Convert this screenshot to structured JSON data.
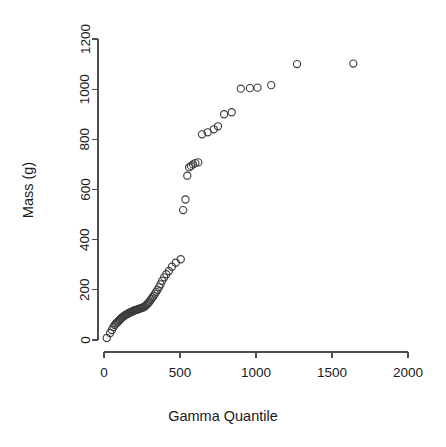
{
  "plot": {
    "type": "scatter",
    "point_symbol": "open-circle",
    "point_radius_px": 3.6,
    "point_color": "#3c3c3c",
    "background": "#ffffff",
    "axis_color": "#4d4d4d"
  },
  "chart_data": {
    "type": "scatter",
    "title": "",
    "subtitle": "",
    "xlabel": "Gamma Quantile",
    "ylabel": "Mass (g)",
    "xlim": [
      0,
      2000
    ],
    "ylim": [
      0,
      1200
    ],
    "xticks": [
      0,
      500,
      1000,
      1500,
      2000
    ],
    "yticks": [
      0,
      200,
      400,
      600,
      800,
      1000,
      1200
    ],
    "xtick_labels": [
      "0",
      "500",
      "1000",
      "1500",
      "2000"
    ],
    "ytick_labels": [
      "0",
      "200",
      "400",
      "600",
      "800",
      "1000",
      "1200"
    ],
    "grid": false,
    "legend": null,
    "annotations": [],
    "series": [
      {
        "name": "Mass vs Gamma Quantile",
        "marker": "open-circle",
        "x": [
          18,
          40,
          52,
          62,
          71,
          79,
          86,
          93,
          100,
          106,
          112,
          118,
          124,
          130,
          136,
          141,
          147,
          152,
          158,
          163,
          168,
          174,
          179,
          184,
          190,
          195,
          200,
          206,
          211,
          216,
          222,
          227,
          233,
          238,
          244,
          249,
          255,
          261,
          267,
          273,
          279,
          285,
          292,
          298,
          305,
          312,
          319,
          327,
          335,
          343,
          352,
          362,
          372,
          383,
          396,
          410,
          427,
          447,
          472,
          505,
          521,
          536,
          548,
          560,
          572,
          586,
          601,
          620,
          645,
          682,
          722,
          750,
          790,
          840,
          900,
          960,
          1010,
          1100,
          1270,
          1640
        ],
        "y": [
          8,
          28,
          40,
          52,
          60,
          66,
          70,
          74,
          78,
          82,
          86,
          88,
          92,
          95,
          97,
          100,
          101,
          103,
          105,
          107,
          109,
          110,
          112,
          113,
          115,
          116,
          118,
          119,
          120,
          121,
          122,
          123,
          124,
          126,
          127,
          128,
          129,
          131,
          133,
          136,
          140,
          144,
          148,
          152,
          158,
          164,
          170,
          176,
          184,
          192,
          200,
          210,
          222,
          236,
          250,
          262,
          275,
          292,
          308,
          322,
          518,
          560,
          655,
          688,
          694,
          700,
          705,
          708,
          820,
          828,
          840,
          852,
          900,
          908,
          1002,
          1004,
          1006,
          1016,
          1100,
          1102
        ]
      }
    ]
  }
}
